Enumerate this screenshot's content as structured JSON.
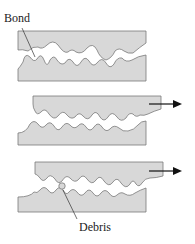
{
  "figure": {
    "labels": {
      "bond": "Bond",
      "debris": "Debris"
    },
    "stages": [
      {
        "name": "bonded-contact",
        "arrow": false
      },
      {
        "name": "sliding-shear",
        "arrow": true
      },
      {
        "name": "debris-formation",
        "arrow": true
      }
    ],
    "colors": {
      "fill": "#d8d8d8",
      "stroke": "#7a7a7a",
      "arrow": "#111111",
      "text": "#222222"
    }
  }
}
